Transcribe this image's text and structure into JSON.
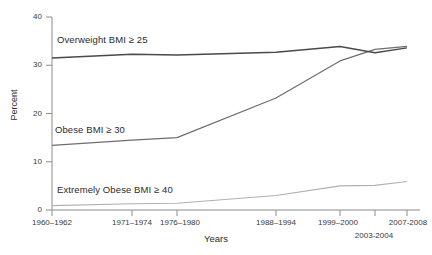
{
  "chart_data": {
    "type": "line",
    "title": "",
    "xlabel": "Years",
    "ylabel": "Percent",
    "ylim": [
      0,
      40
    ],
    "yticks": [
      0,
      10,
      20,
      30,
      40
    ],
    "grid": false,
    "legend_position": "inline-annotations",
    "categories": [
      "1960–1962",
      "1971–1974",
      "1976–1980",
      "1988–1994",
      "1999–2000",
      "2003-2004",
      "2007-2008"
    ],
    "series": [
      {
        "name": "Overweight  BMI ≥ 25",
        "short_name": "Overweight",
        "threshold_label": "BMI ≥ 25",
        "color": "#4a4a4a",
        "values": [
          31.5,
          32.3,
          32.1,
          32.7,
          33.9,
          32.6,
          33.6
        ]
      },
      {
        "name": "Obese  BMI ≥ 30",
        "short_name": "Obese",
        "threshold_label": "BMI ≥ 30",
        "color": "#6e6e6e",
        "values": [
          13.4,
          14.5,
          15.0,
          23.2,
          30.9,
          33.3,
          33.9
        ]
      },
      {
        "name": "Extremely Obese  BMI ≥ 40",
        "short_name": "Extremely Obese",
        "threshold_label": "BMI ≥ 40",
        "color": "#b0b0b0",
        "values": [
          0.9,
          1.3,
          1.4,
          3.0,
          5.0,
          5.1,
          5.9
        ]
      }
    ]
  },
  "axes": {
    "y_title": "Percent",
    "x_title": "Years",
    "y_tick_labels": [
      "0",
      "10",
      "20",
      "30",
      "40"
    ],
    "x_tick_labels": [
      "1960–1962",
      "1971–1974",
      "1976–1980",
      "1988–1994",
      "1999–2000",
      "2003-2004",
      "2007-2008"
    ]
  },
  "annotations": {
    "overweight": "Overweight   BMI ≥ 25",
    "obese": "Obese   BMI ≥ 30",
    "extremely_obese": "Extremely Obese   BMI ≥ 40"
  },
  "colors": {
    "overweight_line": "#4a4a4a",
    "obese_line": "#6e6e6e",
    "extremely_obese_line": "#b0b0b0",
    "axis": "#8c8c8c",
    "text": "#2b2b2b",
    "background": "#ffffff"
  }
}
